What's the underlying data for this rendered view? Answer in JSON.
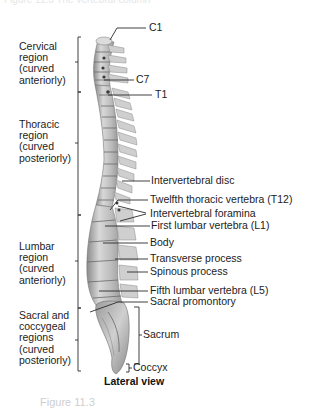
{
  "header": {
    "faint_text": "Figure 11.3 The vertebral column"
  },
  "diagram": {
    "title": "Lateral view",
    "regions": [
      {
        "name": "cervical",
        "lines": [
          "Cervical",
          "region",
          "(curved",
          "anteriorly)"
        ]
      },
      {
        "name": "thoracic",
        "lines": [
          "Thoracic",
          "region",
          "(curved",
          "posteriorly)"
        ]
      },
      {
        "name": "lumbar",
        "lines": [
          "Lumbar",
          "region",
          "(curved",
          "anteriorly)"
        ]
      },
      {
        "name": "sacral-coccygeal",
        "lines": [
          "Sacral and",
          "coccygeal",
          "regions",
          "(curved",
          "posteriorly)"
        ]
      }
    ],
    "labels": {
      "c1": "C1",
      "c7": "C7",
      "t1": "T1",
      "intervertebral_disc": "Intervertebral disc",
      "t12": "Twelfth thoracic vertebra (T12)",
      "intervertebral_foramina": "Intervertebral foramina",
      "l1": "First lumbar vertebra (L1)",
      "body": "Body",
      "transverse_process": "Transverse process",
      "spinous_process": "Spinous process",
      "l5": "Fifth lumbar vertebra (L5)",
      "sacral_promontory": "Sacral promontory",
      "sacrum": "Sacrum",
      "coccyx": "Coccyx"
    }
  },
  "footer": {
    "faint_caption": "Figure 11.3"
  },
  "colors": {
    "bone_light": "#e2e2e2",
    "bone_mid": "#b9b9b9",
    "bone_dark": "#7a7a7a",
    "text": "#1c1c1c",
    "line": "#2a2a2a"
  }
}
